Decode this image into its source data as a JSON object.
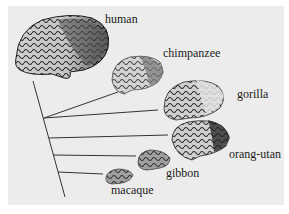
{
  "figure": {
    "type": "phylogenetic brain comparison",
    "species": [
      {
        "id": "human",
        "label": "human"
      },
      {
        "id": "chimpanzee",
        "label": "chimpanzee"
      },
      {
        "id": "gorilla",
        "label": "gorilla"
      },
      {
        "id": "orang-utan",
        "label": "orang-utan"
      },
      {
        "id": "gibbon",
        "label": "gibbon"
      },
      {
        "id": "macaque",
        "label": "macaque"
      }
    ],
    "colors": {
      "background": "#ececec",
      "line": "#333333",
      "brain_dark": "#3a3a3a",
      "brain_light": "#d8d8d8"
    }
  }
}
